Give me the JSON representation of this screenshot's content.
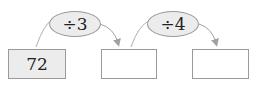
{
  "diagram": {
    "boxes": [
      {
        "value": "72",
        "fill": "#ececec"
      },
      {
        "value": "",
        "fill": "#ffffff"
      },
      {
        "value": "",
        "fill": "#ffffff"
      }
    ],
    "operations": [
      {
        "label": "÷3"
      },
      {
        "label": "÷4"
      }
    ]
  }
}
